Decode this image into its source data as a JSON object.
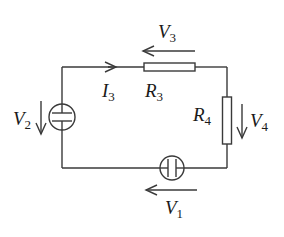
{
  "diagram": {
    "type": "circuit",
    "colors": {
      "wire": "#3a3a3a",
      "background": "#ffffff"
    },
    "labels": {
      "V1": {
        "main": "V",
        "sub": "1"
      },
      "V2": {
        "main": "V",
        "sub": "2"
      },
      "V3": {
        "main": "V",
        "sub": "3"
      },
      "V4": {
        "main": "V",
        "sub": "4"
      },
      "R3": {
        "main": "R",
        "sub": "3"
      },
      "R4": {
        "main": "R",
        "sub": "4"
      },
      "I3": {
        "main": "I",
        "sub": "3"
      }
    },
    "components": [
      {
        "id": "V2",
        "kind": "voltage-source",
        "position": "left branch",
        "arrow": "down"
      },
      {
        "id": "R3",
        "kind": "resistor",
        "position": "top branch",
        "arrow": "left"
      },
      {
        "id": "R4",
        "kind": "resistor",
        "position": "right branch",
        "arrow": "down"
      },
      {
        "id": "V1",
        "kind": "voltage-source",
        "position": "bottom branch",
        "arrow": "left"
      }
    ],
    "current": {
      "id": "I3",
      "direction": "right",
      "position": "top-left wire"
    }
  }
}
